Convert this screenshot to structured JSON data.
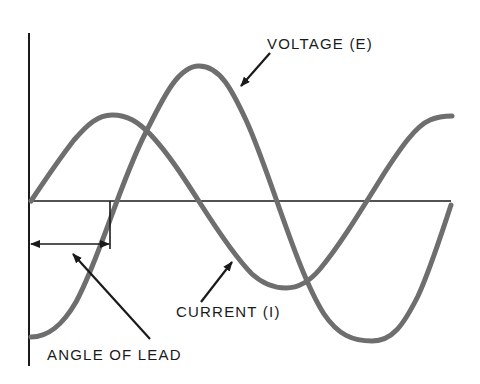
{
  "diagram": {
    "labels": {
      "voltage": "VOLTAGE (E)",
      "current": "CURRENT (I)",
      "angle_of_lead": "ANGLE OF LEAD"
    },
    "colors": {
      "curve": "#6e6e6e",
      "axis": "#1a1a1a",
      "text": "#1a1a1a",
      "background": "#ffffff"
    },
    "axes": {
      "vertical": {
        "x": 29,
        "y_top": 33,
        "y_bottom": 366
      },
      "horizontal": {
        "y": 201,
        "x_left": 29,
        "x_right": 451
      }
    },
    "curves": [
      {
        "name": "voltage",
        "label": "VOLTAGE (E)",
        "start_x": 31,
        "end_x": 450,
        "baseline_y": 201,
        "amplitude": 136,
        "period_px": 344,
        "phase_start": "minimum"
      },
      {
        "name": "current",
        "label": "CURRENT (I)",
        "start_x": 31,
        "end_x": 450,
        "baseline_y": 201,
        "amplitude": 86,
        "period_px": 344,
        "phase_start": "zero-rising"
      }
    ],
    "angle_of_lead": {
      "arrow_y": 244,
      "x_from": 31,
      "x_to": 110,
      "tick_x": 110
    }
  }
}
